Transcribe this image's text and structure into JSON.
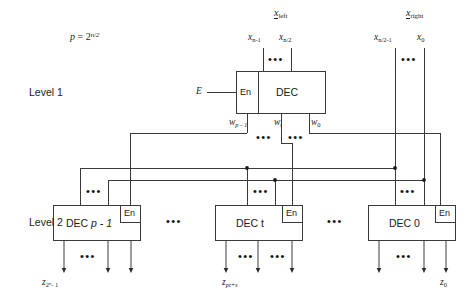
{
  "figure": {
    "title_note": "p = 2^(n/2)",
    "p_formula": {
      "lhs": "p",
      "eq": "=",
      "base": "2",
      "exponent": "n/2"
    },
    "levels": [
      {
        "id": "level-1",
        "caption": "Level 1"
      },
      {
        "id": "level-2",
        "caption": "Level 2"
      }
    ],
    "inputs": {
      "left_vector": {
        "name": "x",
        "subscript": "left"
      },
      "right_vector": {
        "name": "x",
        "subscript": "right"
      },
      "left_bits": [
        {
          "name": "x",
          "subscript": "n-1"
        },
        {
          "name": "x",
          "subscript": "n/2"
        }
      ],
      "right_bits": [
        {
          "name": "x",
          "subscript": "n/2-1"
        },
        {
          "name": "x",
          "subscript": "0"
        }
      ],
      "enable": {
        "name": "E"
      }
    },
    "level1": {
      "box_label": "DEC",
      "enable_pin": "En",
      "outputs": [
        {
          "name": "w",
          "subscript": "p - 1"
        },
        {
          "name": "w",
          "subscript": "t"
        },
        {
          "name": "w",
          "subscript": "0"
        }
      ]
    },
    "level2": {
      "boxes": [
        {
          "label": "DEC",
          "index": "p - 1",
          "enable_pin": "En",
          "out_label": {
            "name": "z",
            "subscript": "2^n - 1",
            "sub_base": "2",
            "sub_exp": "n",
            "sub_tail": "- 1"
          }
        },
        {
          "label": "DEC",
          "index": "t",
          "enable_pin": "En",
          "out_label": {
            "name": "z",
            "subscript": "pt+s"
          }
        },
        {
          "label": "DEC",
          "index": "0",
          "enable_pin": "En",
          "out_label": {
            "name": "z",
            "subscript": "0"
          }
        }
      ]
    },
    "ellipsis": "•••",
    "colors": {
      "ink": "#1a1a1a",
      "line": "#3a3a3a",
      "background": "#ffffff"
    }
  }
}
